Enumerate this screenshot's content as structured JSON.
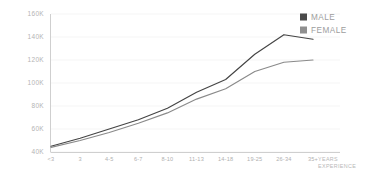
{
  "chart_data": {
    "type": "line",
    "title": "",
    "subtitle": "",
    "xlabel": "YEARS EXPERIENCE",
    "xlabel_lines": [
      "YEARS",
      "EXPERIENCE"
    ],
    "ylabel": "",
    "categories": [
      "<3",
      "3",
      "4-5",
      "6-7",
      "8-10",
      "11-13",
      "14-18",
      "19-25",
      "26-34",
      "35+"
    ],
    "ylim": [
      40000,
      160000
    ],
    "ytick_labels": [
      "160K",
      "140K",
      "120K",
      "100K",
      "80K",
      "60K",
      "40K"
    ],
    "ytick_values": [
      160000,
      140000,
      120000,
      100000,
      80000,
      60000,
      40000
    ],
    "grid": true,
    "legend_position": "top-right",
    "series": [
      {
        "name": "MALE",
        "color": "#444444",
        "values": [
          45000,
          52000,
          60000,
          68000,
          78000,
          92000,
          103000,
          125000,
          142000,
          138000
        ]
      },
      {
        "name": "FEMALE",
        "color": "#8a8a8a",
        "values": [
          44000,
          50000,
          57000,
          65000,
          74000,
          86000,
          95000,
          110000,
          118000,
          120000
        ]
      }
    ]
  },
  "legend": {
    "items": [
      {
        "label": "MALE",
        "swatch_color": "#4a4a4a"
      },
      {
        "label": "FEMALE",
        "swatch_color": "#8f8f8f"
      }
    ]
  },
  "colors": {
    "grid": "#f0f0f0",
    "axis": "#c9c9c9",
    "tick_text": "#b4b4b4",
    "legend_text": "#9d9d9d",
    "background": "#ffffff"
  }
}
